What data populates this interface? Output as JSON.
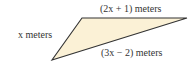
{
  "diagram": {
    "fill_color": "#fbf1d6",
    "stroke_color": "#333333",
    "labels": {
      "left_side": "x meters",
      "top_side": "(2x + 1) meters",
      "bottom_side": "(3x − 2) meters"
    }
  }
}
